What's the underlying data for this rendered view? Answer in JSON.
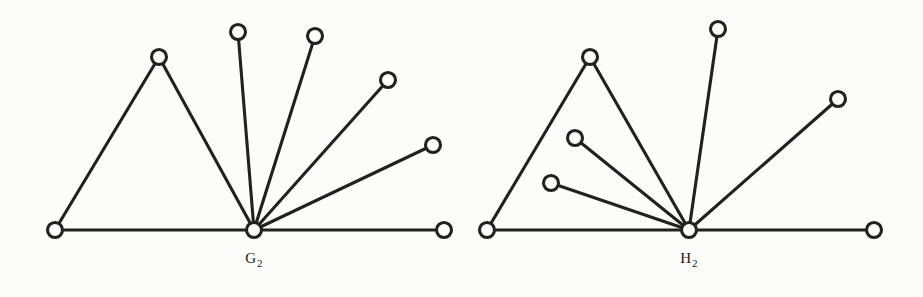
{
  "figure": {
    "background_color": "#fcfcfa",
    "ink_color": "#23211f",
    "width": 923,
    "height": 297
  },
  "chart_data": {
    "type": "diagram",
    "subtype": "node-link-graph",
    "xlabel": "",
    "ylabel": "",
    "grid": false,
    "legend": null,
    "graphs": [
      {
        "name": "G2",
        "label": "G",
        "label_subscript": "2",
        "label_text": "G2",
        "label_position": {
          "x": 254,
          "y": 258
        },
        "vertex_count": 8,
        "edge_count": 8,
        "hub_vertex": "g_hub",
        "hub_degree": 7,
        "nodes": [
          {
            "id": "g_left",
            "x": 55,
            "y": 230,
            "r": 7.5,
            "role": "path-end-left"
          },
          {
            "id": "g_apex",
            "x": 159,
            "y": 57,
            "r": 7.5,
            "role": "triangle-apex"
          },
          {
            "id": "g_hub",
            "x": 254,
            "y": 230,
            "r": 7.5,
            "role": "hub"
          },
          {
            "id": "g_s1",
            "x": 238,
            "y": 32,
            "r": 7.5,
            "role": "spoke-leaf"
          },
          {
            "id": "g_s2",
            "x": 315,
            "y": 36,
            "r": 7.5,
            "role": "spoke-leaf"
          },
          {
            "id": "g_s3",
            "x": 388,
            "y": 80,
            "r": 7.5,
            "role": "spoke-leaf"
          },
          {
            "id": "g_s4",
            "x": 433,
            "y": 145,
            "r": 7.5,
            "role": "spoke-leaf"
          },
          {
            "id": "g_right",
            "x": 444,
            "y": 230,
            "r": 7.5,
            "role": "path-end-right"
          }
        ],
        "edges": [
          {
            "from": "g_left",
            "to": "g_apex"
          },
          {
            "from": "g_left",
            "to": "g_hub"
          },
          {
            "from": "g_apex",
            "to": "g_hub"
          },
          {
            "from": "g_hub",
            "to": "g_s1"
          },
          {
            "from": "g_hub",
            "to": "g_s2"
          },
          {
            "from": "g_hub",
            "to": "g_s3"
          },
          {
            "from": "g_hub",
            "to": "g_s4"
          },
          {
            "from": "g_hub",
            "to": "g_right"
          }
        ]
      },
      {
        "name": "H2",
        "label": "H",
        "label_subscript": "2",
        "label_text": "H2",
        "label_position": {
          "x": 689,
          "y": 258
        },
        "vertex_count": 8,
        "edge_count": 8,
        "hub_vertex": "h_hub",
        "hub_degree": 7,
        "nodes": [
          {
            "id": "h_left",
            "x": 487,
            "y": 230,
            "r": 7.5,
            "role": "path-end-left"
          },
          {
            "id": "h_apex",
            "x": 590,
            "y": 57,
            "r": 7.5,
            "role": "triangle-apex"
          },
          {
            "id": "h_in1",
            "x": 575,
            "y": 138,
            "r": 7.5,
            "role": "inner-leaf"
          },
          {
            "id": "h_in2",
            "x": 551,
            "y": 183,
            "r": 7.5,
            "role": "inner-leaf"
          },
          {
            "id": "h_hub",
            "x": 689,
            "y": 230,
            "r": 7.5,
            "role": "hub"
          },
          {
            "id": "h_top",
            "x": 718,
            "y": 29,
            "r": 7.5,
            "role": "spoke-leaf"
          },
          {
            "id": "h_s1",
            "x": 838,
            "y": 99,
            "r": 7.5,
            "role": "spoke-leaf"
          },
          {
            "id": "h_right",
            "x": 874,
            "y": 230,
            "r": 7.5,
            "role": "path-end-right"
          }
        ],
        "edges": [
          {
            "from": "h_left",
            "to": "h_apex"
          },
          {
            "from": "h_left",
            "to": "h_hub"
          },
          {
            "from": "h_apex",
            "to": "h_hub"
          },
          {
            "from": "h_hub",
            "to": "h_in1"
          },
          {
            "from": "h_hub",
            "to": "h_in2"
          },
          {
            "from": "h_hub",
            "to": "h_top"
          },
          {
            "from": "h_hub",
            "to": "h_s1"
          },
          {
            "from": "h_hub",
            "to": "h_right"
          }
        ]
      }
    ]
  }
}
